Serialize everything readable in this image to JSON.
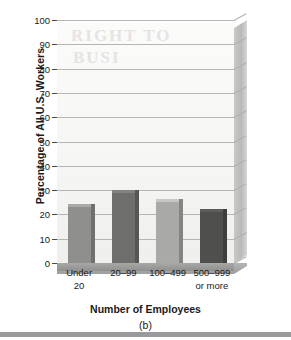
{
  "chart_data": {
    "type": "bar",
    "title": "",
    "xlabel": "Number of Employees",
    "ylabel": "Percentage of All U.S. Workers",
    "panel_label": "(b)",
    "categories": [
      "Under 20",
      "20–99",
      "100–499",
      "500–999 or more"
    ],
    "category_lines": [
      {
        "line1": "Under",
        "line2": "20"
      },
      {
        "line1": "20–99",
        "line2": ""
      },
      {
        "line1": "100–499",
        "line2": ""
      },
      {
        "line1": "500–999",
        "line2": "or more"
      }
    ],
    "values": [
      23,
      29,
      25,
      21
    ],
    "ylim": [
      0,
      100
    ],
    "ytick_step": 10,
    "yticks": [
      "100",
      "90",
      "80",
      "70",
      "60",
      "50",
      "40",
      "30",
      "20",
      "10",
      "0"
    ],
    "grid": true,
    "legend": "none",
    "bar_colors": [
      "#8f8f8d",
      "#6e6e6c",
      "#a9a9a7",
      "#4f4f4d"
    ],
    "style": "3d-wall-and-floor"
  },
  "artifact": {
    "ghost_line1": "RIGHT TO",
    "ghost_line2": "BUSI"
  }
}
